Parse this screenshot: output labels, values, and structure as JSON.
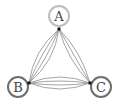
{
  "diagram": {
    "type": "multigraph",
    "nodes": [
      {
        "id": "A",
        "label": "A",
        "cx": 59,
        "cy": 16,
        "r": 10,
        "ring_color": "#bdbdbd",
        "port": [
          59,
          29
        ]
      },
      {
        "id": "B",
        "label": "B",
        "cx": 18,
        "cy": 87,
        "r": 10,
        "ring_color": "#6e6e6e",
        "port": [
          29,
          83
        ]
      },
      {
        "id": "C",
        "label": "C",
        "cx": 101,
        "cy": 87,
        "r": 10,
        "ring_color": "#6e6e6e",
        "port": [
          90,
          83
        ]
      }
    ],
    "edges": [
      {
        "from": "A",
        "to": "B",
        "count": 4
      },
      {
        "from": "A",
        "to": "C",
        "count": 3
      },
      {
        "from": "B",
        "to": "C",
        "count": 4
      }
    ],
    "edge_color": "#9a9a9a",
    "port_color": "#111111"
  }
}
